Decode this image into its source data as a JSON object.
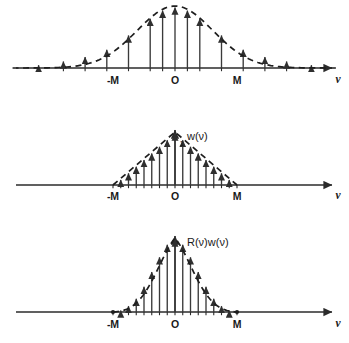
{
  "figure": {
    "background": "#ffffff",
    "ink_color": "#1a1a1a",
    "stem_color": "#3a3a3a",
    "axis_variable": "ν",
    "tick_labels": {
      "negative_m": "-M",
      "origin": "O",
      "positive_m": "M"
    }
  },
  "chart_data": [
    {
      "type": "scatter",
      "panel": "top",
      "title": "",
      "series_label": "",
      "xlabel": "ν",
      "ylabel": "",
      "xlim": [
        -2.6,
        2.6
      ],
      "ylim": [
        0,
        1.05
      ],
      "grid": false,
      "legend": "none",
      "curve_style": "dashed",
      "x_tick_values": [
        -1,
        0,
        1
      ],
      "x_tick_labels": [
        "-M",
        "O",
        "M"
      ],
      "description": "Autocorrelation R(ν): bell-shaped dashed envelope with vertical stems (sampled values) rising from the ν axis to the curve.",
      "x": [
        -2.2,
        -1.8,
        -1.45,
        -1.1,
        -0.75,
        -0.4,
        -0.2,
        0.0,
        0.2,
        0.4,
        0.75,
        1.1,
        1.45,
        1.8,
        2.2
      ],
      "values": [
        0.07,
        0.13,
        0.2,
        0.32,
        0.55,
        0.82,
        0.95,
        1.0,
        0.95,
        0.82,
        0.55,
        0.32,
        0.2,
        0.13,
        0.07
      ]
    },
    {
      "type": "scatter",
      "panel": "middle",
      "title": "",
      "series_label": "w(ν)",
      "xlabel": "ν",
      "ylabel": "w(ν)",
      "peak_label": "1",
      "xlim": [
        -2.6,
        2.6
      ],
      "ylim": [
        0,
        1.05
      ],
      "grid": false,
      "legend": "none",
      "curve_style": "dashed",
      "x_tick_values": [
        -1,
        0,
        1
      ],
      "x_tick_labels": [
        "-M",
        "O",
        "M"
      ],
      "description": "Triangular (Bartlett) lag window w(ν): dashed triangle peaking at 1 at the origin and falling linearly to zero at ±M, with vertical stems.",
      "x": [
        -1.0,
        -0.875,
        -0.75,
        -0.625,
        -0.5,
        -0.375,
        -0.25,
        -0.125,
        0.0,
        0.125,
        0.25,
        0.375,
        0.5,
        0.625,
        0.75,
        0.875,
        1.0
      ],
      "values": [
        0.0,
        0.125,
        0.25,
        0.375,
        0.5,
        0.625,
        0.75,
        0.875,
        1.0,
        0.875,
        0.75,
        0.625,
        0.5,
        0.375,
        0.25,
        0.125,
        0.0
      ]
    },
    {
      "type": "scatter",
      "panel": "bottom",
      "title": "",
      "series_label": "R(ν)w(ν)",
      "xlabel": "ν",
      "ylabel": "R(ν)w(ν)",
      "xlim": [
        -2.6,
        2.6
      ],
      "ylim": [
        0,
        1.05
      ],
      "grid": false,
      "legend": "none",
      "curve_style": "dashed",
      "x_tick_values": [
        -1,
        0,
        1
      ],
      "x_tick_labels": [
        "-M",
        "O",
        "M"
      ],
      "description": "Product R(ν)w(ν): truncated bell-shaped dashed curve vanishing at ±M, with vertical stems.",
      "x": [
        -1.0,
        -0.875,
        -0.75,
        -0.625,
        -0.5,
        -0.375,
        -0.25,
        -0.125,
        0.0,
        0.125,
        0.25,
        0.375,
        0.5,
        0.625,
        0.75,
        0.875,
        1.0
      ],
      "values": [
        0.0,
        0.04,
        0.1,
        0.2,
        0.36,
        0.56,
        0.76,
        0.93,
        1.0,
        0.93,
        0.76,
        0.56,
        0.36,
        0.2,
        0.1,
        0.04,
        0.0
      ]
    }
  ]
}
